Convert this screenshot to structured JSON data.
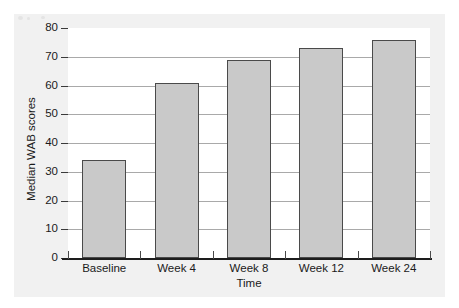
{
  "chart_data": {
    "type": "bar",
    "title": "",
    "subtitle": "",
    "xlabel": "Time",
    "ylabel": "Median WAB scores",
    "categories": [
      "Baseline",
      "Week 4",
      "Week 8",
      "Week 12",
      "Week 24"
    ],
    "values": [
      34,
      61,
      69,
      73,
      76
    ],
    "series": [
      {
        "name": "Median WAB scores",
        "values": [
          34,
          61,
          69,
          73,
          76
        ]
      }
    ],
    "ylim": [
      0,
      80
    ],
    "ytick_labels": [
      "0",
      "10",
      "20",
      "30",
      "40",
      "50",
      "60",
      "70",
      "80"
    ],
    "ytick_values": [
      0,
      10,
      20,
      30,
      40,
      50,
      60,
      70,
      80
    ],
    "ytick_interval": 10,
    "grid": true,
    "grid_axis": "y",
    "legend": false,
    "legend_position": "none",
    "annotations": [],
    "colors": {
      "bar_fill": "#c9c9c9",
      "bar_border": "#4a4a4a",
      "gridline": "#a9a9a9",
      "axis_line": "#1d1d1d",
      "text": "#1a1a1a",
      "plot_background": "#ffffff",
      "panel_background": "#f1f1f1"
    }
  }
}
